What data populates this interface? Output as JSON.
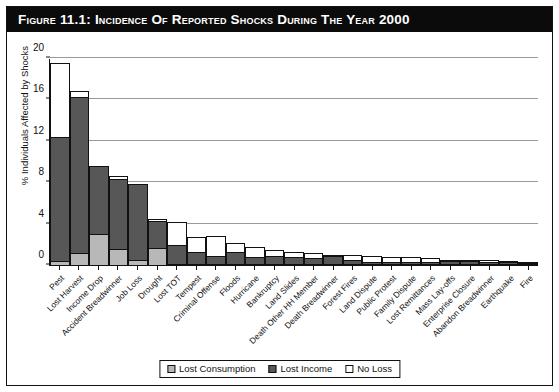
{
  "figure": {
    "title": "Figure 11.1: Incidence of Reported Shocks During the Year 2000"
  },
  "chart_data": {
    "type": "bar",
    "subtype": "stacked-vertical",
    "title": "Figure 11.1: Incidence of Reported Shocks During the Year 2000",
    "xlabel": "",
    "ylabel": "% Individuals Affected by Shocks",
    "ylim": [
      0,
      20
    ],
    "yticks": [
      0,
      4,
      8,
      12,
      16,
      20
    ],
    "grid": true,
    "legend_position": "bottom-center",
    "categories": [
      "Pest",
      "Lost Harvest",
      "Income Drop",
      "Accident Breadwinner",
      "Job Loss",
      "Drought",
      "Lost TOT",
      "Tempest",
      "Criminal Offense",
      "Floods",
      "Hurricane",
      "Bankruptcy",
      "Land Slides",
      "Death Other HH Member",
      "Death Breadwinner",
      "Forest Fires",
      "Land Dispute",
      "Public Protest",
      "Family Dispute",
      "Lost Remittances",
      "Mass Lay-offs",
      "Enterprise Closure",
      "Abandon Breadwinner",
      "Earthquake",
      "Fire"
    ],
    "series": [
      {
        "name": "Lost Consumption",
        "color": "#b8b8b8",
        "values": [
          0.5,
          1.3,
          3.1,
          1.6,
          0.6,
          1.7,
          0.2,
          0.1,
          0.1,
          0.1,
          0.1,
          0.1,
          0.1,
          0.1,
          0.1,
          0.1,
          0.1,
          0.1,
          0.1,
          0.1,
          0.1,
          0.1,
          0.1,
          0.1,
          0.1
        ]
      },
      {
        "name": "Lost Income",
        "color": "#575757",
        "values": [
          12.1,
          15.1,
          6.7,
          6.9,
          7.4,
          2.7,
          1.9,
          1.3,
          0.9,
          1.3,
          0.8,
          0.9,
          0.8,
          0.7,
          0.9,
          0.5,
          0.3,
          0.3,
          0.3,
          0.3,
          0.4,
          0.4,
          0.3,
          0.3,
          0.2
        ]
      },
      {
        "name": "No Loss",
        "color": "#ffffff",
        "values": [
          7.2,
          0.7,
          0.0,
          0.4,
          0.0,
          0.3,
          2.3,
          1.5,
          2.0,
          0.9,
          1.0,
          0.6,
          0.6,
          0.6,
          0.1,
          0.6,
          0.7,
          0.6,
          0.6,
          0.5,
          0.2,
          0.2,
          0.3,
          0.2,
          0.2
        ]
      }
    ],
    "totals": [
      19.8,
      17.1,
      9.8,
      8.9,
      8.0,
      4.7,
      4.4,
      2.9,
      3.0,
      2.3,
      1.9,
      1.6,
      1.5,
      1.4,
      1.1,
      1.2,
      1.1,
      1.0,
      1.0,
      0.9,
      0.7,
      0.7,
      0.7,
      0.6,
      0.5
    ]
  },
  "legend": {
    "items": [
      {
        "label": "Lost Consumption",
        "swatch": "consum"
      },
      {
        "label": "Lost Income",
        "swatch": "income"
      },
      {
        "label": "No Loss",
        "swatch": "noloss"
      }
    ]
  }
}
